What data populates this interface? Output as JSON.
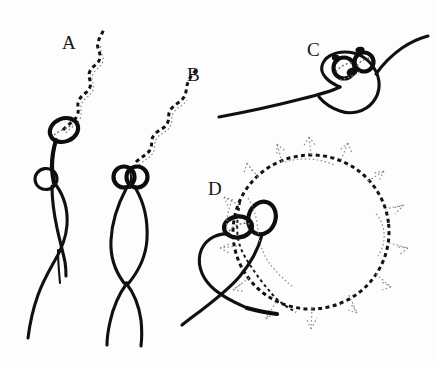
{
  "figure": {
    "background_color": "#fdfdfd",
    "ink_color": "#111111",
    "light_ink_color": "#8d8d8d",
    "width": 437,
    "height": 366,
    "panels": [
      {
        "id": "A",
        "label": "A",
        "label_x": 62,
        "label_y": 49,
        "description": "Dashed filament trailing up-right from an open ellipse loop, thick stem descending to a small loop and long forked tail"
      },
      {
        "id": "B",
        "label": "B",
        "label_x": 187,
        "label_y": 81,
        "description": "Dashed filament trailing up-right into twin small circles above a long crossing double-strand loop with forked tail"
      },
      {
        "id": "C",
        "label": "C",
        "label_x": 307,
        "label_y": 56,
        "description": "Long sweeping solid curve from lower left forming a loop with two small dotted circles at its crest, exiting upper right"
      },
      {
        "id": "D",
        "label": "D",
        "label_x": 208,
        "label_y": 195,
        "description": "Large bold dashed circle with light dotted radiating spikes, attached at left to two solid ellipses and a heart shaped solid loop with crossing tails"
      }
    ]
  }
}
